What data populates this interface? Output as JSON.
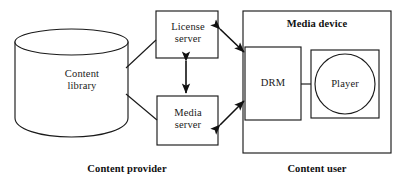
{
  "diagram": {
    "title_hidden": "",
    "nodes": {
      "content_library": {
        "label": "Content\nlibrary",
        "shape": "cylinder"
      },
      "license_server": {
        "label": "License\nserver",
        "shape": "rectangle"
      },
      "media_server": {
        "label": "Media\nserver",
        "shape": "rectangle"
      },
      "drm": {
        "label": "DRM",
        "shape": "rectangle"
      },
      "player": {
        "label": "Player",
        "shape": "circle-in-rectangle"
      },
      "media_device": {
        "label": "Media device",
        "shape": "rectangle-container"
      }
    },
    "group_labels": {
      "content_provider": "Content provider",
      "content_user": "Content user"
    },
    "edges": [
      {
        "from": "content_library",
        "to": "license_server",
        "style": "plain-line"
      },
      {
        "from": "content_library",
        "to": "media_server",
        "style": "plain-line"
      },
      {
        "from": "license_server",
        "to": "media_server",
        "style": "double-arrow-vertical"
      },
      {
        "from": "license_server",
        "to": "drm",
        "style": "double-arrow-diagonal"
      },
      {
        "from": "media_server",
        "to": "drm",
        "style": "double-arrow-diagonal"
      },
      {
        "from": "drm",
        "to": "player",
        "style": "plain-line"
      }
    ],
    "colors": {
      "stroke": "#1a1a1a",
      "background": "#ffffff",
      "text": "#1a1a1a"
    }
  }
}
